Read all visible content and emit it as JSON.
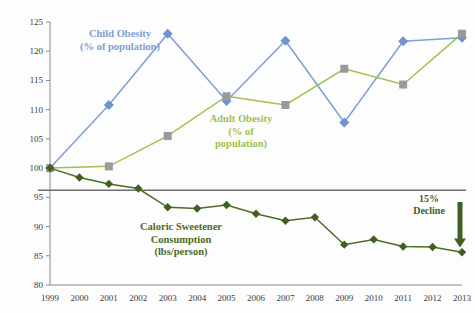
{
  "chart_data": {
    "type": "line",
    "title": "",
    "subtitle": "",
    "xlabel": "",
    "ylabel": "",
    "x": [
      1999,
      2000,
      2001,
      2002,
      2003,
      2004,
      2005,
      2006,
      2007,
      2008,
      2009,
      2010,
      2011,
      2012,
      2013
    ],
    "xtick_labels": [
      "1999",
      "2000",
      "2001",
      "2002",
      "2003",
      "2004",
      "2005",
      "2006",
      "2007",
      "2008",
      "2009",
      "2010",
      "2011",
      "2012",
      "2013"
    ],
    "ytick_labels": [
      "80",
      "85",
      "90",
      "95",
      "100",
      "105",
      "110",
      "115",
      "120",
      "125"
    ],
    "ytick_values": [
      80,
      85,
      90,
      95,
      100,
      105,
      110,
      115,
      120,
      125
    ],
    "ylim": [
      80,
      125
    ],
    "xlim": [
      1999,
      2013
    ],
    "grid": false,
    "legend": "inline-annotations",
    "series": [
      {
        "name": "Child Obesity (% of population)",
        "color": "#7e9fd4",
        "marker": "diamond",
        "marker_color": "#6f93cd",
        "x": [
          1999,
          2001,
          2003,
          2005,
          2007,
          2009,
          2011,
          2013
        ],
        "values": [
          100.0,
          110.8,
          123.0,
          111.5,
          121.8,
          107.8,
          121.7,
          122.3
        ]
      },
      {
        "name": "Adult Obesity (% of population)",
        "color": "#9dc34b",
        "marker": "square",
        "marker_color": "#9a9a9a",
        "x": [
          1999,
          2001,
          2003,
          2005,
          2007,
          2009,
          2011,
          2013
        ],
        "values": [
          100.0,
          100.3,
          105.5,
          112.3,
          110.8,
          117.0,
          114.3,
          123.0
        ]
      },
      {
        "name": "Caloric Sweetener Consumption (lbs/person)",
        "color": "#4e6b22",
        "marker": "diamond",
        "marker_color": "#3f6020",
        "x": [
          1999,
          2000,
          2001,
          2002,
          2003,
          2004,
          2005,
          2006,
          2007,
          2008,
          2009,
          2010,
          2011,
          2012,
          2013
        ],
        "values": [
          100.0,
          98.4,
          97.3,
          96.5,
          93.3,
          93.1,
          93.7,
          92.2,
          91.0,
          91.6,
          86.9,
          87.8,
          86.6,
          86.5,
          85.6
        ]
      }
    ],
    "reference_line": {
      "value": 96.2,
      "color": "#6e6e6e"
    },
    "annotations": [
      {
        "name": "child-obesity-label",
        "text_lines": [
          "Child Obesity",
          "(% of population)"
        ],
        "color": "#7e9fd4",
        "x": 1999.6,
        "y": 121.0
      },
      {
        "name": "adult-obesity-label",
        "text_lines": [
          "Adult Obesity",
          "(% of",
          "population)"
        ],
        "color": "#9dc34b",
        "x": 2005.3,
        "y": 108.5
      },
      {
        "name": "caloric-sweetener-label",
        "text_lines": [
          "Caloric Sweetener",
          "Consumption",
          "(lbs/person)"
        ],
        "color": "#4e6b22",
        "x": 2004.3,
        "y": 89.5
      },
      {
        "name": "decline-label",
        "text_lines": [
          "15%",
          "Decline"
        ],
        "color": "#3f6020",
        "x": 2012.6,
        "y": 94.5,
        "arrow": "down"
      }
    ]
  },
  "labels": {
    "child_line1": "Child Obesity",
    "child_line2": "(% of population)",
    "adult_line1": "Adult Obesity",
    "adult_line2": "(% of",
    "adult_line3": "population)",
    "cal_line1": "Caloric Sweetener",
    "cal_line2": "Consumption",
    "cal_line3": "(lbs/person)",
    "decline_line1": "15%",
    "decline_line2": "Decline"
  },
  "colors": {
    "child": "#7e9fd4",
    "adult": "#9dc34b",
    "adult_marker": "#9a9a9a",
    "caloric": "#4e6b22",
    "axis": "#8a8a8a",
    "reference": "#6e6e6e",
    "tick_text": "#3a3a3a"
  }
}
